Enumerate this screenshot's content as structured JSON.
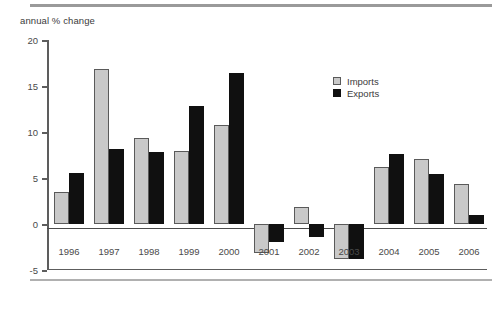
{
  "caption": "annual % change",
  "legend": {
    "position": "inside-top-right",
    "items": [
      {
        "label": "Imports",
        "color": "#c9c9c9",
        "border": "#5a5a5a"
      },
      {
        "label": "Exports",
        "color": "#101010",
        "border": "#101010"
      }
    ]
  },
  "axes": {
    "y_ticks": [
      20,
      15,
      10,
      5,
      0,
      -5
    ],
    "y_tick_labels": [
      "20",
      "15",
      "10",
      "5",
      "0",
      "-5"
    ],
    "x_tick_labels": [
      "1996",
      "1997",
      "1998",
      "1999",
      "2000",
      "2001",
      "2002",
      "2003",
      "2004",
      "2005",
      "2006"
    ]
  },
  "chart_data": {
    "type": "bar",
    "title": "",
    "subtitle": "",
    "xlabel": "",
    "ylabel": "annual % change",
    "ylim": [
      -5,
      20
    ],
    "ytick_step": 5,
    "grid": false,
    "legend_position": "inside-top-right",
    "zero_baseline": true,
    "categories": [
      "1996",
      "1997",
      "1998",
      "1999",
      "2000",
      "2001",
      "2002",
      "2003",
      "2004",
      "2005",
      "2006"
    ],
    "series": [
      {
        "name": "Imports",
        "color": "#c9c9c9",
        "values": [
          3.5,
          16.8,
          9.3,
          7.9,
          10.8,
          -3.2,
          1.9,
          -3.8,
          6.2,
          7.1,
          4.4
        ]
      },
      {
        "name": "Exports",
        "color": "#101010",
        "values": [
          5.5,
          8.2,
          7.8,
          12.8,
          16.4,
          -2.0,
          -1.4,
          -3.8,
          7.6,
          5.4,
          1.0
        ]
      }
    ]
  }
}
